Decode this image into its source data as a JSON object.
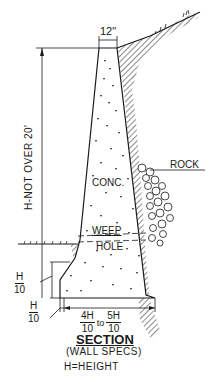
{
  "drawing": {
    "top_width": "12\"",
    "height_label": "H-NOT OVER 20'",
    "material_label": "CONC.",
    "rock_label": "ROCK",
    "weep_label_1": "WEEP",
    "weep_label_2": "HOLE",
    "toe_height": {
      "num": "H",
      "den": "10"
    },
    "toe_width": {
      "num": "H",
      "den": "10"
    },
    "base_width": {
      "num1": "4H",
      "den1": "10",
      "to": "to",
      "num2": "5H",
      "den2": "10"
    }
  },
  "caption": {
    "title": "SECTION",
    "subtitle": "(WALL SPECS)",
    "note": "H=HEIGHT"
  },
  "colors": {
    "ink": "#1a1a1a",
    "background": "#ffffff"
  }
}
